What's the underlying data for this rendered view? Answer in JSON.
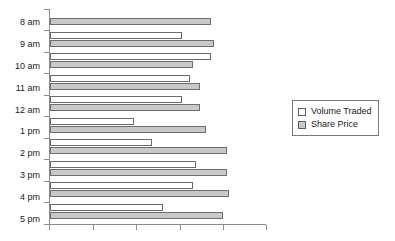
{
  "chart_data": {
    "type": "bar",
    "orientation": "horizontal",
    "title": "",
    "xlabel": "",
    "ylabel": "",
    "grid": false,
    "legend_position": "right",
    "xlim": [
      0,
      5
    ],
    "xticks": [
      0,
      1,
      2,
      3,
      4,
      5
    ],
    "xtick_labels": [
      "",
      "",
      "",
      "",
      "",
      ""
    ],
    "categories": [
      "8 am",
      "9 am",
      "10 am",
      "11 am",
      "12 am",
      "1 pm",
      "2 pm",
      "3 pm",
      "4 pm",
      "5 pm"
    ],
    "series": [
      {
        "name": "Volume Traded",
        "color": "#ffffff",
        "values": [
          0.0,
          3.05,
          3.72,
          3.23,
          3.05,
          1.95,
          2.37,
          3.39,
          3.3,
          2.62
        ]
      },
      {
        "name": "Share Price",
        "color": "#c9c9c9",
        "values": [
          3.72,
          3.79,
          3.3,
          3.47,
          3.47,
          3.61,
          4.09,
          4.09,
          4.14,
          4.0
        ]
      }
    ]
  },
  "legend": {
    "items": [
      {
        "label": "Volume Traded",
        "swatch": "volume"
      },
      {
        "label": "Share Price",
        "swatch": "price"
      }
    ]
  }
}
